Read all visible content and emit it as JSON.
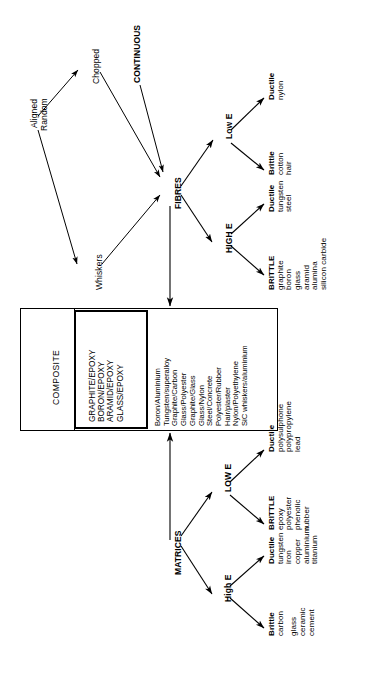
{
  "diagram": {
    "orientation": "rotated-90-ccw",
    "colors": {
      "ink": "#000000",
      "paper": "#ffffff"
    }
  },
  "fibres_branch": {
    "root_label": "FIBRES",
    "inputs": {
      "aligned_random": "Aligned\nRandom",
      "aligned": "Aligned",
      "random": "Random",
      "chopped": "Chopped",
      "whiskers": "Whiskers",
      "continuous": "CONTINUOUS"
    },
    "modulus_groups": [
      {
        "label": "Low E"
      },
      {
        "label": "HIGH E"
      }
    ],
    "leaves": [
      {
        "group": "Low E",
        "ductility": "Ductile",
        "items": [
          "nylon"
        ]
      },
      {
        "group": "Low E",
        "ductility": "Brittle",
        "items": [
          "cotton",
          "hair"
        ]
      },
      {
        "group": "HIGH E",
        "ductility": "Ductile",
        "items": [
          "tungsten",
          "steel"
        ]
      },
      {
        "group": "HIGH E",
        "ductility": "BRITTLE",
        "items": [
          "graphite",
          "boron",
          "glass",
          "aramid",
          "alumina",
          "silicon carbide"
        ]
      }
    ]
  },
  "matrices_branch": {
    "root_label": "MATRICES",
    "modulus_groups": [
      {
        "label": "LOW E"
      },
      {
        "label": "High E"
      }
    ],
    "leaves": [
      {
        "group": "LOW E",
        "ductility": "Ductile",
        "items": [
          "polysulphone",
          "polypropylene",
          "lead"
        ]
      },
      {
        "group": "LOW E",
        "ductility": "BRITTLE",
        "items": [
          "epoxy",
          "polyester",
          "phenolic",
          "rubber"
        ]
      },
      {
        "group": "High E",
        "ductility": "Ductile",
        "items": [
          "tungsten",
          "iron",
          "copper",
          "aluminium",
          "titanium"
        ]
      },
      {
        "group": "High E",
        "ductility": "Brittle",
        "items": [
          "carbon",
          "",
          "glass",
          "ceramic",
          "cement"
        ]
      }
    ]
  },
  "composite_box": {
    "title": "COMPOSITE",
    "highlighted_systems": [
      "GRAPHITE/EPOXY",
      "BORON/EPOXY",
      "ARAMID/EPOXY",
      "GLASS/EPOXY"
    ],
    "other_systems": [
      "Boron/Aluminium",
      "Tungsten/superalloy",
      "Graphite/Carbon",
      "Glass/Polyester",
      "Graphite/Glass",
      "Glass/Nylon",
      "Steel/Concrete",
      "Polyester/Rubber",
      "Hair/plaster",
      "Nylon/Polyethylene",
      "SiC whiskers/aluminium"
    ]
  },
  "leaf_text": {
    "l_lowE_ductile": "Ductile",
    "l_lowE_ductile_1": "nylon",
    "l_lowE_brittle": "Brittle",
    "l_lowE_brittle_1": "cotton",
    "l_lowE_brittle_2": "hair",
    "l_highE_ductile": "Ductile",
    "l_highE_ductile_1": "tungsten",
    "l_highE_ductile_2": "steel",
    "l_highE_brittle": "BRITTLE",
    "l_highE_brittle_1": "graphite",
    "l_highE_brittle_2": "boron",
    "l_highE_brittle_3": "glass",
    "l_highE_brittle_4": "aramid",
    "l_highE_brittle_5": "alumina",
    "l_highE_brittle_6": "silicon carbide",
    "m_lowE_ductile": "Ductile",
    "m_lowE_ductile_1": "polysulphone",
    "m_lowE_ductile_2": "polypropylene",
    "m_lowE_ductile_3": "lead",
    "m_lowE_brittle": "BRITTLE",
    "m_lowE_brittle_1": "epoxy",
    "m_lowE_brittle_2": "polyester",
    "m_lowE_brittle_3": "phenolic",
    "m_lowE_brittle_4": "rubber",
    "m_highE_ductile": "Ductile",
    "m_highE_ductile_1": "tungsten",
    "m_highE_ductile_2": "iron",
    "m_highE_ductile_3": "copper",
    "m_highE_ductile_4": "aluminium",
    "m_highE_ductile_5": "titanium",
    "m_highE_brittle": "Brittle",
    "m_highE_brittle_1": "carbon",
    "m_highE_brittle_2": "glass",
    "m_highE_brittle_3": "ceramic",
    "m_highE_brittle_4": "cement"
  },
  "box_text": {
    "title": "COMPOSITE",
    "hl_1": "GRAPHITE/EPOXY",
    "hl_2": "BORON/EPOXY",
    "hl_3": "ARAMID/EPOXY",
    "hl_4": "GLASS/EPOXY",
    "o_1": "Boron/Aluminium",
    "o_2": "Tungsten/superalloy",
    "o_3": "Graphite/Carbon",
    "o_4": "Glass/Polyester",
    "o_5": "Graphite/Glass",
    "o_6": "Glass/Nylon",
    "o_7": "Steel/Concrete",
    "o_8": "Polyester/Rubber",
    "o_9": "Hair/plaster",
    "o_10": "Nylon/Polyethylene",
    "o_11": "SiC whiskers/aluminium"
  },
  "node_text": {
    "aligned": "Aligned",
    "random": "Random",
    "chopped": "Chopped",
    "whiskers": "Whiskers",
    "continuous": "CONTINUOUS",
    "fibres": "FIBRES",
    "fibres_low_e": "Low E",
    "fibres_high_e": "HIGH E",
    "matrices": "MATRICES",
    "matrices_low_e": "LOW E",
    "matrices_high_e": "High E"
  }
}
